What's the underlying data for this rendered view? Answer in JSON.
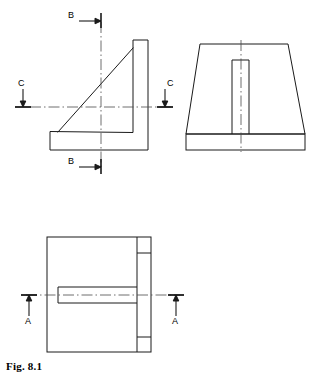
{
  "figure": {
    "caption": "Fig. 8.1",
    "kind": "orthographic-engineering-drawing"
  },
  "colors": {
    "background": "#ffffff",
    "line": "#1a1a1a",
    "centerline": "#4a4a4a",
    "text": "#000000"
  },
  "section_markers": [
    {
      "id": "b-top",
      "label": "B",
      "view": "front-view",
      "direction": "right",
      "arrow": "horizontal"
    },
    {
      "id": "b-bottom",
      "label": "B",
      "view": "front-view",
      "direction": "right",
      "arrow": "horizontal"
    },
    {
      "id": "c-left",
      "label": "C",
      "view": "front-view",
      "direction": "down",
      "arrow": "vertical"
    },
    {
      "id": "c-right",
      "label": "C",
      "view": "front-view",
      "direction": "down",
      "arrow": "vertical"
    },
    {
      "id": "a-left",
      "label": "A",
      "view": "top-view",
      "direction": "up",
      "arrow": "vertical"
    },
    {
      "id": "a-right",
      "label": "A",
      "view": "top-view",
      "direction": "up",
      "arrow": "vertical"
    }
  ],
  "views": [
    {
      "id": "front-view",
      "name": "Front view (left)",
      "shape": "L-shaped bracket with diagonal rib",
      "outline": "50,132 50,150 148,150 148,40 133,40 133,132",
      "rib_diagonal": {
        "x1": 58,
        "y1": 132,
        "x2": 133,
        "y2": 48
      },
      "centerline_vertical_x": 101,
      "centerline_horizontal_y": 107
    },
    {
      "id": "side-view",
      "name": "Side view (right)",
      "shape": "Trapezoid body on rectangular base plate, slot visible",
      "trapezoid": "200,44 288,44 305,134 186,134",
      "base_plate": {
        "x": 186,
        "y": 134,
        "w": 119,
        "h": 16
      },
      "slot": {
        "x": 232,
        "y": 60,
        "w": 17,
        "h": 74
      },
      "centerline_vertical_x": 241
    },
    {
      "id": "top-view",
      "name": "Top view (bottom)",
      "shape": "Rectangle with right flange band and central slot",
      "outline": {
        "x": 47,
        "y": 237,
        "w": 104,
        "h": 115
      },
      "flange_line_x": 137,
      "flange_tick_y": [
        253,
        337
      ],
      "slot": {
        "x": 58,
        "y": 287,
        "w": 79,
        "h": 16
      },
      "centerline_horizontal_y": 295
    }
  ]
}
